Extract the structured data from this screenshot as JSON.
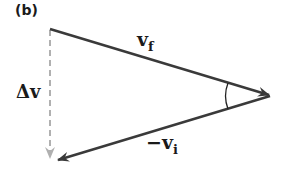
{
  "figure": {
    "panel_label": "(b)",
    "vectors": [
      {
        "name": "v_f",
        "label": "v",
        "subscript": "f",
        "from": [
          50,
          29
        ],
        "to": [
          271,
          95
        ],
        "style": "solid",
        "color": "#3a3a3a"
      },
      {
        "name": "-v_i",
        "label": "−v",
        "subscript": "i",
        "from": [
          271,
          95
        ],
        "to": [
          55,
          160
        ],
        "style": "solid",
        "color": "#3a3a3a"
      },
      {
        "name": "delta_v",
        "label": "Δv",
        "from": [
          50,
          29
        ],
        "to": [
          50,
          160
        ],
        "style": "dashed",
        "color": "#a8a8a8"
      }
    ],
    "angle_marker": "arc at apex (right vertex)"
  }
}
